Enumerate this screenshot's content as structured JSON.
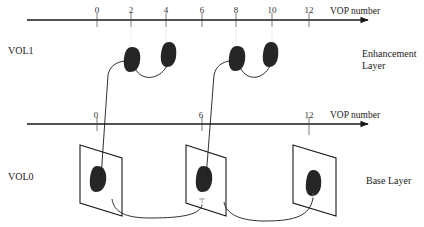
{
  "diagram": {
    "type": "temporal-scalability-layers",
    "layers": [
      {
        "id": "VOL1",
        "label": "VOL1",
        "layer_name": "Enhancement Layer",
        "axis": {
          "title": "VOP number",
          "ticks": [
            {
              "value": "0",
              "x": 97
            },
            {
              "value": "2",
              "x": 131
            },
            {
              "value": "4",
              "x": 166
            },
            {
              "value": "6",
              "x": 202
            },
            {
              "value": "8",
              "x": 236
            },
            {
              "value": "10",
              "x": 272
            },
            {
              "value": "12",
              "x": 309
            }
          ]
        },
        "vops": [
          {
            "vop": "2",
            "cx": 131,
            "cy": 61
          },
          {
            "vop": "4",
            "cx": 168,
            "cy": 58
          },
          {
            "vop": "8",
            "cx": 236,
            "cy": 61
          },
          {
            "vop": "10",
            "cx": 270,
            "cy": 58
          }
        ]
      },
      {
        "id": "VOL0",
        "label": "VOL0",
        "layer_name": "Base Layer",
        "axis": {
          "title": "VOP number",
          "ticks": [
            {
              "value": "0",
              "x": 97
            },
            {
              "value": "6",
              "x": 202
            },
            {
              "value": "12",
              "x": 309
            }
          ]
        },
        "vops": [
          {
            "vop": "0",
            "cx": 97,
            "cy": 178
          },
          {
            "vop": "6",
            "cx": 203,
            "cy": 178
          },
          {
            "vop": "12",
            "cx": 313,
            "cy": 182
          }
        ]
      }
    ],
    "labels": {
      "vol1": "VOL1",
      "vol0": "VOL0",
      "enhancement_line1": "Enhancement",
      "enhancement_line2": "Layer",
      "base": "Base Layer",
      "axis_top_title": "VOP number",
      "axis_bottom_title": "VOP number"
    },
    "colors": {
      "line": "#1a1a1a",
      "blob": "#262626",
      "background": "#ffffff"
    }
  }
}
